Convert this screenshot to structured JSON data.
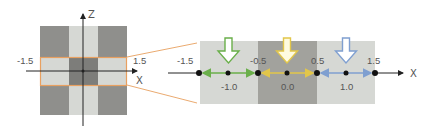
{
  "left_figure": {
    "axis_labels": {
      "vertical": "Z",
      "horizontal": "X"
    },
    "band_labels": {
      "left": "-1.5",
      "right": "1.5"
    },
    "colors": {
      "dark": "#8f8f8c",
      "light": "#d6d8d4",
      "center": "#7d7d7a",
      "band_outline": "#e8a060"
    }
  },
  "right_figure": {
    "axis_label": "X",
    "top_labels": [
      "-1.5",
      "-0.5",
      "0.5",
      "1.5"
    ],
    "bottom_labels": [
      "-1.0",
      "0.0",
      "1.0"
    ],
    "segments": [
      {
        "name": "green",
        "from": -1.5,
        "to": -0.5,
        "center": -1.0,
        "color": "#6aaf4a"
      },
      {
        "name": "yellow",
        "from": -0.5,
        "to": 0.5,
        "center": 0.0,
        "color": "#e2c64a"
      },
      {
        "name": "blue",
        "from": 0.5,
        "to": 1.5,
        "center": 1.0,
        "color": "#7f9fd0"
      }
    ],
    "colors": {
      "light_panel": "#d6d8d4",
      "dark_panel": "#a2a29d"
    }
  }
}
